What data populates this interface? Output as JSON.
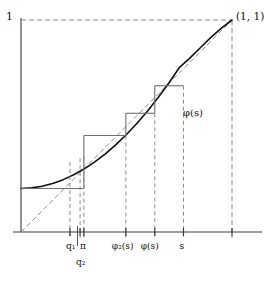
{
  "figure": {
    "name": "cobweb-diagram-phi",
    "axis_max_label": "1",
    "corner_point_label": "(1, 1)",
    "curve_label": "φ(s)",
    "x_axis_ticks": [
      {
        "id": "q1",
        "label": "q₁",
        "x_frac": 0.232,
        "curve_y_frac": 0.33
      },
      {
        "id": "pi",
        "label": "π",
        "x_frac": 0.298,
        "curve_y_frac": 0.355
      },
      {
        "id": "q2",
        "label": "q₂",
        "x_frac": 0.28,
        "curve_y_frac": 0.348,
        "below": true
      },
      {
        "id": "phi2s",
        "label": "φ₂(s)",
        "x_frac": 0.497,
        "curve_y_frac": 0.455
      },
      {
        "id": "phis",
        "label": "φ(s)",
        "x_frac": 0.634,
        "curve_y_frac": 0.56
      },
      {
        "id": "s",
        "label": "s",
        "x_frac": 0.77,
        "curve_y_frac": 0.69
      }
    ],
    "colors": {
      "axis": "#3a3a3a",
      "curve": "#111111",
      "dashed": "#8b8b8b",
      "cobweb": "#6e6e6e",
      "text": "#111111"
    },
    "curve": {
      "description": "generating function phi(s), convex increasing from phi(0)>0 to (1,1)",
      "phi_at_zero": 0.205,
      "points": [
        [
          0.0,
          0.205
        ],
        [
          0.05,
          0.208
        ],
        [
          0.1,
          0.216
        ],
        [
          0.15,
          0.229
        ],
        [
          0.2,
          0.247
        ],
        [
          0.25,
          0.27
        ],
        [
          0.3,
          0.298
        ],
        [
          0.35,
          0.331
        ],
        [
          0.4,
          0.369
        ],
        [
          0.45,
          0.412
        ],
        [
          0.5,
          0.46
        ],
        [
          0.55,
          0.513
        ],
        [
          0.6,
          0.571
        ],
        [
          0.65,
          0.634
        ],
        [
          0.7,
          0.702
        ],
        [
          0.75,
          0.775
        ],
        [
          0.8,
          0.82
        ],
        [
          0.85,
          0.869
        ],
        [
          0.9,
          0.918
        ],
        [
          0.95,
          0.962
        ],
        [
          1.0,
          1.0
        ]
      ]
    },
    "cobweb_steps": [
      {
        "from_x": 0.77,
        "to_x": 0.634,
        "y": 0.69
      },
      {
        "from_x": 0.634,
        "to_x": 0.497,
        "y": 0.56
      },
      {
        "from_x": 0.497,
        "to_x": 0.298,
        "y": 0.455
      },
      {
        "from_x": 0.298,
        "to_x": 0.0,
        "y": 0.205
      }
    ],
    "diagonal_label": "y = s"
  }
}
